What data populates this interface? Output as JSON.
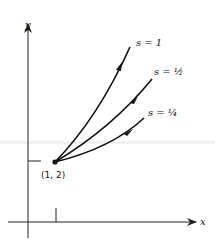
{
  "diagram": {
    "axes": {
      "x_label": "x",
      "y_label": "y"
    },
    "point": {
      "label": "(1, 2)",
      "x": 1,
      "y": 2
    },
    "curves": [
      {
        "label": "s = 1",
        "s": 1
      },
      {
        "label": "s = ½",
        "s": 0.5
      },
      {
        "label": "s = ¼",
        "s": 0.25
      }
    ],
    "colors": {
      "ink": "#111111",
      "background": "#ffffff"
    }
  }
}
